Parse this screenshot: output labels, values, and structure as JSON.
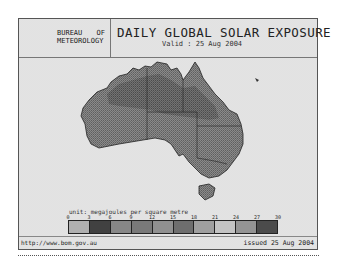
{
  "header": {
    "logo_line1_a": "BUREAU",
    "logo_line1_b": "OF",
    "logo_line2": "METEOROLOGY",
    "title": "DAILY GLOBAL SOLAR EXPOSURE",
    "valid": "Valid : 25 Aug 2004"
  },
  "map": {
    "region": "Australia",
    "land_color": "#7a7a7a",
    "land_dark_color": "#5e5e5e",
    "ocean_color": "#f4f4f4"
  },
  "legend": {
    "unit_label": "unit: megajoules per square metre",
    "ticks": [
      "0",
      "3",
      "6",
      "9",
      "12",
      "15",
      "18",
      "21",
      "24",
      "27",
      "30"
    ],
    "colors": [
      "#c8c8c8",
      "#4a4a4a",
      "#9a9a9a",
      "#8a8a8a",
      "#a4a4a4",
      "#7d7d7d",
      "#b5b5b5",
      "#dedede",
      "#a9a9a9",
      "#555555"
    ]
  },
  "footer": {
    "url": "http://www.bom.gov.au",
    "issued": "issued 25 Aug 2004"
  }
}
